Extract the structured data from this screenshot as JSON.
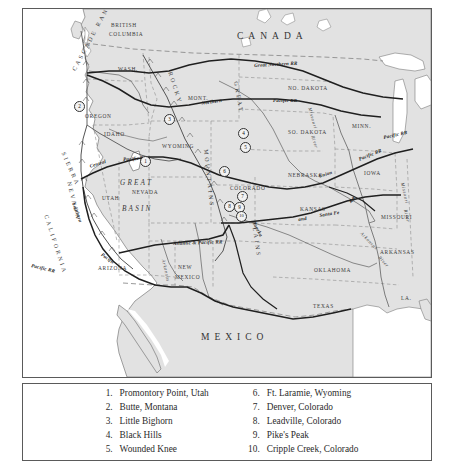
{
  "map": {
    "countries": [
      {
        "name": "CANADA",
        "x": 214,
        "y": 22
      },
      {
        "name": "MEXICO",
        "x": 178,
        "y": 323
      }
    ],
    "states": [
      {
        "name": "BRITISH",
        "x": 88,
        "y": 13
      },
      {
        "name": "COLUMBIA",
        "x": 86,
        "y": 22
      },
      {
        "name": "WASH.",
        "x": 95,
        "y": 57
      },
      {
        "name": "OREGON",
        "x": 62,
        "y": 104
      },
      {
        "name": "IDAHO",
        "x": 81,
        "y": 122
      },
      {
        "name": "MONT.",
        "x": 165,
        "y": 86
      },
      {
        "name": "WYOMING",
        "x": 139,
        "y": 134
      },
      {
        "name": "UTAH",
        "x": 79,
        "y": 186
      },
      {
        "name": "NEVADA",
        "x": 109,
        "y": 180
      },
      {
        "name": "ARIZONA",
        "x": 75,
        "y": 256
      },
      {
        "name": "NEW",
        "x": 155,
        "y": 255
      },
      {
        "name": "MEXICO",
        "x": 152,
        "y": 265
      },
      {
        "name": "COLORADO",
        "x": 207,
        "y": 176
      },
      {
        "name": "NO. DAKOTA",
        "x": 265,
        "y": 76
      },
      {
        "name": "SO. DAKOTA",
        "x": 265,
        "y": 120
      },
      {
        "name": "NEBRASKA",
        "x": 265,
        "y": 163
      },
      {
        "name": "KANSAS",
        "x": 277,
        "y": 197
      },
      {
        "name": "OKLAHOMA",
        "x": 291,
        "y": 258
      },
      {
        "name": "TEXAS",
        "x": 290,
        "y": 294
      },
      {
        "name": "MINN.",
        "x": 329,
        "y": 114
      },
      {
        "name": "IOWA",
        "x": 341,
        "y": 161
      },
      {
        "name": "MISSOURI",
        "x": 358,
        "y": 205
      },
      {
        "name": "ARKANSAS",
        "x": 357,
        "y": 240
      },
      {
        "name": "LA.",
        "x": 378,
        "y": 286
      }
    ],
    "regions": [
      {
        "name": "GREAT",
        "x": 97,
        "y": 170
      },
      {
        "name": "BASIN",
        "x": 99,
        "y": 196
      }
    ],
    "ranges": [
      {
        "name": "CASCADE RANGE",
        "x": 48,
        "y": 60,
        "rotate": -62
      },
      {
        "name": "SIERRA",
        "x": 43,
        "y": 142,
        "rotate": 66
      },
      {
        "name": "NEVADA",
        "x": 49,
        "y": 172,
        "rotate": 76
      },
      {
        "name": "CALIFORNIA",
        "x": 26,
        "y": 205,
        "rotate": 72
      },
      {
        "name": "ROCKY",
        "x": 150,
        "y": 62,
        "rotate": 72
      },
      {
        "name": "MOUNTAINS",
        "x": 186,
        "y": 140,
        "rotate": 84
      },
      {
        "name": "GREAT",
        "x": 216,
        "y": 72,
        "rotate": 80
      },
      {
        "name": "PLAINS",
        "x": 234,
        "y": 212,
        "rotate": 82
      }
    ],
    "railroads": [
      {
        "name": "Great Northern RR",
        "x": 231,
        "y": 54,
        "rotate": -3
      },
      {
        "name": "Northern",
        "x": 178,
        "y": 92,
        "rotate": -9
      },
      {
        "name": "Pacific RR",
        "x": 250,
        "y": 89,
        "rotate": 0
      },
      {
        "name": "Central",
        "x": 66,
        "y": 155,
        "rotate": -17
      },
      {
        "name": "Pacific RR",
        "x": 100,
        "y": 148,
        "rotate": -4
      },
      {
        "name": "Southern",
        "x": 53,
        "y": 193,
        "rotate": 70
      },
      {
        "name": "Pacific",
        "x": 80,
        "y": 243,
        "rotate": 36
      },
      {
        "name": "Atlantic & Pacific RR",
        "x": 150,
        "y": 232,
        "rotate": -2
      },
      {
        "name": "Pacific RR",
        "x": 9,
        "y": 254,
        "rotate": 14
      },
      {
        "name": "Union",
        "x": 295,
        "y": 165,
        "rotate": -17
      },
      {
        "name": "Pacific RR",
        "x": 335,
        "y": 148,
        "rotate": -22
      },
      {
        "name": "Santa Fe",
        "x": 296,
        "y": 204,
        "rotate": -9
      },
      {
        "name": "RR",
        "x": 325,
        "y": 191,
        "rotate": -38
      },
      {
        "name": "and",
        "x": 275,
        "y": 208,
        "rotate": -8
      },
      {
        "name": "Topeka",
        "x": 233,
        "y": 212,
        "rotate": 62
      },
      {
        "name": "Pacific RR",
        "x": 360,
        "y": 126,
        "rotate": -12
      }
    ],
    "rivers": [
      {
        "name": "Missouri",
        "x": 289,
        "y": 98,
        "rotate": 74
      },
      {
        "name": "River",
        "x": 292,
        "y": 126,
        "rotate": 72
      },
      {
        "name": "Missouri",
        "x": 382,
        "y": 173,
        "rotate": 78
      },
      {
        "name": "River",
        "x": 385,
        "y": 200,
        "rotate": 78
      },
      {
        "name": "Arkansas",
        "x": 340,
        "y": 222,
        "rotate": 46
      },
      {
        "name": "River",
        "x": 358,
        "y": 246,
        "rotate": 48
      },
      {
        "name": "Arkansas",
        "x": 143,
        "y": 250,
        "rotate": 78
      }
    ],
    "markers": [
      {
        "num": "1",
        "x": 117,
        "y": 147
      },
      {
        "num": "2",
        "x": 51,
        "y": 92
      },
      {
        "num": "3",
        "x": 141,
        "y": 105
      },
      {
        "num": "4",
        "x": 215,
        "y": 119
      },
      {
        "num": "5",
        "x": 217,
        "y": 133
      },
      {
        "num": "6",
        "x": 196,
        "y": 157
      },
      {
        "num": "7",
        "x": 214,
        "y": 182
      },
      {
        "num": "8",
        "x": 201,
        "y": 192
      },
      {
        "num": "9",
        "x": 211,
        "y": 193
      },
      {
        "num": "10",
        "x": 213,
        "y": 202
      }
    ]
  },
  "legend": {
    "column_left": [
      {
        "num": "1.",
        "text": "Promontory Point, Utah"
      },
      {
        "num": "2.",
        "text": "Butte, Montana"
      },
      {
        "num": "3.",
        "text": "Little Bighorn"
      },
      {
        "num": "4.",
        "text": "Black Hills"
      },
      {
        "num": "5.",
        "text": "Wounded Knee"
      }
    ],
    "column_right": [
      {
        "num": "6.",
        "text": "Ft. Laramie, Wyoming"
      },
      {
        "num": "7.",
        "text": "Denver, Colorado"
      },
      {
        "num": "8.",
        "text": "Leadville, Colorado"
      },
      {
        "num": "9.",
        "text": "Pike's Peak"
      },
      {
        "num": "10.",
        "text": "Cripple Creek, Colorado"
      }
    ]
  },
  "colors": {
    "land": "#e2e2e2",
    "ocean": "#ffffff",
    "coastline": "#7a7a7a",
    "border_solid": "#555555",
    "border_dashed": "#8d8d8d",
    "railroad": "#1f1f1f",
    "river": "#6f6f6f",
    "frame": "#5a5a5a"
  }
}
